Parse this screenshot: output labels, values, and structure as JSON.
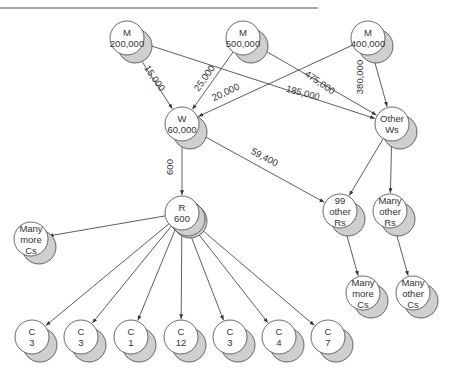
{
  "diagram": {
    "nodes": [
      {
        "id": "m1",
        "lines": [
          "M",
          "200,000"
        ],
        "x": 127,
        "y": 38
      },
      {
        "id": "m2",
        "lines": [
          "M",
          "500,000"
        ],
        "x": 243,
        "y": 38
      },
      {
        "id": "m3",
        "lines": [
          "M",
          "400,000"
        ],
        "x": 368,
        "y": 38
      },
      {
        "id": "w",
        "lines": [
          "W",
          "60,000"
        ],
        "x": 182,
        "y": 124
      },
      {
        "id": "ow",
        "lines": [
          "Other",
          "Ws"
        ],
        "x": 392,
        "y": 124
      },
      {
        "id": "r",
        "lines": [
          "R",
          "600"
        ],
        "x": 182,
        "y": 213
      },
      {
        "id": "r99",
        "lines": [
          "99",
          "other",
          "Rs"
        ],
        "x": 340,
        "y": 211
      },
      {
        "id": "rmany",
        "lines": [
          "Many",
          "other",
          "Rs"
        ],
        "x": 390,
        "y": 211
      },
      {
        "id": "cmore_left",
        "lines": [
          "Many",
          "more",
          "Cs"
        ],
        "x": 31,
        "y": 239
      },
      {
        "id": "cmore_right",
        "lines": [
          "Many",
          "more",
          "Cs"
        ],
        "x": 363,
        "y": 293
      },
      {
        "id": "cother",
        "lines": [
          "Many",
          "other",
          "Cs"
        ],
        "x": 413,
        "y": 293
      },
      {
        "id": "c1",
        "lines": [
          "C",
          "3"
        ],
        "x": 32,
        "y": 337
      },
      {
        "id": "c2",
        "lines": [
          "C",
          "3"
        ],
        "x": 81,
        "y": 337
      },
      {
        "id": "c3",
        "lines": [
          "C",
          "1"
        ],
        "x": 131,
        "y": 337
      },
      {
        "id": "c4",
        "lines": [
          "C",
          "12"
        ],
        "x": 181,
        "y": 337
      },
      {
        "id": "c5",
        "lines": [
          "C",
          "3"
        ],
        "x": 230,
        "y": 337
      },
      {
        "id": "c6",
        "lines": [
          "C",
          "4"
        ],
        "x": 279,
        "y": 337
      },
      {
        "id": "c7",
        "lines": [
          "C",
          "7"
        ],
        "x": 328,
        "y": 337
      }
    ],
    "edges": [
      {
        "from": "m1",
        "to": "w",
        "label": "15,000",
        "lx": 152,
        "ly": 80,
        "angle": 55
      },
      {
        "from": "m2",
        "to": "w",
        "label": "25,000",
        "lx": 207,
        "ly": 80,
        "angle": -55
      },
      {
        "from": "m3",
        "to": "w",
        "label": "20,000",
        "lx": 227,
        "ly": 95,
        "angle": -25
      },
      {
        "from": "m1",
        "to": "ow",
        "label": "185,000",
        "lx": 302,
        "ly": 96,
        "angle": 15
      },
      {
        "from": "m2",
        "to": "ow",
        "label": "475,000",
        "lx": 318,
        "ly": 85,
        "angle": 35
      },
      {
        "from": "m3",
        "to": "ow",
        "label": "380,000",
        "lx": 363,
        "ly": 77,
        "angle": -90
      },
      {
        "from": "w",
        "to": "r",
        "label": "600",
        "lx": 173,
        "ly": 167,
        "angle": -90
      },
      {
        "from": "w",
        "to": "r99",
        "label": "59,400",
        "lx": 263,
        "ly": 160,
        "angle": 28
      },
      {
        "from": "ow",
        "to": "r99",
        "label": "",
        "lx": 0,
        "ly": 0,
        "angle": 0
      },
      {
        "from": "ow",
        "to": "rmany",
        "label": "",
        "lx": 0,
        "ly": 0,
        "angle": 0
      },
      {
        "from": "r99",
        "to": "cmore_right",
        "label": "",
        "lx": 0,
        "ly": 0,
        "angle": 0
      },
      {
        "from": "rmany",
        "to": "cother",
        "label": "",
        "lx": 0,
        "ly": 0,
        "angle": 0
      },
      {
        "from": "r",
        "to": "cmore_left",
        "label": "",
        "lx": 0,
        "ly": 0,
        "angle": 0
      },
      {
        "from": "r",
        "to": "c1",
        "label": "",
        "lx": 0,
        "ly": 0,
        "angle": 0
      },
      {
        "from": "r",
        "to": "c2",
        "label": "",
        "lx": 0,
        "ly": 0,
        "angle": 0
      },
      {
        "from": "r",
        "to": "c3",
        "label": "",
        "lx": 0,
        "ly": 0,
        "angle": 0
      },
      {
        "from": "r",
        "to": "c4",
        "label": "",
        "lx": 0,
        "ly": 0,
        "angle": 0
      },
      {
        "from": "r",
        "to": "c5",
        "label": "",
        "lx": 0,
        "ly": 0,
        "angle": 0
      },
      {
        "from": "r",
        "to": "c6",
        "label": "",
        "lx": 0,
        "ly": 0,
        "angle": 0
      },
      {
        "from": "r",
        "to": "c7",
        "label": "",
        "lx": 0,
        "ly": 0,
        "angle": 0
      }
    ],
    "colors": {
      "node_fill": "#ffffff",
      "shadow_fill": "#cfcfcf",
      "stroke": "#444444",
      "text": "#333333"
    }
  }
}
